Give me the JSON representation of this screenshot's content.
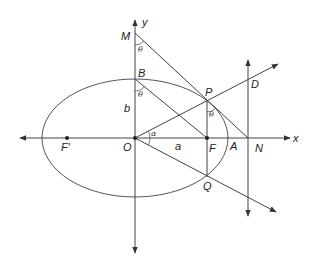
{
  "figure": {
    "type": "ellipse-geometry"
  },
  "colors": {
    "stroke": "#444444",
    "text": "#222222",
    "background": "#ffffff"
  },
  "labels": {
    "y_axis": "y",
    "x_axis": "x",
    "M": "M",
    "B": "B",
    "P": "P",
    "D": "D",
    "O": "O",
    "F": "F",
    "F_prime": "F′",
    "A": "A",
    "N": "N",
    "Q": "Q",
    "b": "b",
    "a": "a",
    "alpha": "α",
    "theta_M": "θ",
    "theta_B": "θ",
    "theta_P": "θ"
  }
}
